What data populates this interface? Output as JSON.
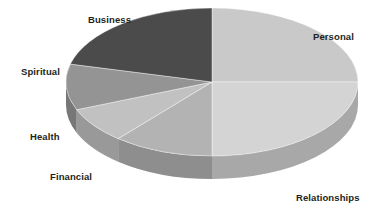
{
  "chart_data": {
    "type": "pie",
    "title": "",
    "subtitle": "",
    "xlabel": "",
    "ylabel": "",
    "legend_position": "none",
    "grid": false,
    "three_d": true,
    "background_color": "#ffffff",
    "label_color": "#231f20",
    "categories": [
      "Personal",
      "Relationships",
      "Financial",
      "Health",
      "Spiritual",
      "Business"
    ],
    "values": [
      25,
      25,
      11,
      8,
      10,
      21
    ],
    "slices": [
      {
        "label": "Personal",
        "value": 25,
        "percent": 25,
        "start_angle": 0,
        "end_angle": 90,
        "color": "#c9c9c9",
        "side_color": "#9f9f9f",
        "label_x": 313,
        "label_y": 31
      },
      {
        "label": "Relationships",
        "value": 25,
        "percent": 25,
        "start_angle": 90,
        "end_angle": 180,
        "color": "#d4d4d4",
        "side_color": "#a8a8a8",
        "label_x": 296,
        "label_y": 192
      },
      {
        "label": "Financial",
        "value": 11,
        "percent": 11,
        "start_angle": 180,
        "end_angle": 220,
        "color": "#b3b3b3",
        "side_color": "#8e8e8e",
        "label_x": 50,
        "label_y": 171
      },
      {
        "label": "Health",
        "value": 8,
        "percent": 8,
        "start_angle": 220,
        "end_angle": 248,
        "color": "#c1c1c1",
        "side_color": "#999999",
        "label_x": 30,
        "label_y": 131
      },
      {
        "label": "Spiritual",
        "value": 10,
        "percent": 10,
        "start_angle": 248,
        "end_angle": 284,
        "color": "#949494",
        "side_color": "#777777",
        "label_x": 21,
        "label_y": 66
      },
      {
        "label": "Business",
        "value": 21,
        "percent": 21,
        "start_angle": 284,
        "end_angle": 360,
        "color": "#4b4b4b",
        "side_color": "#3b3b3b",
        "label_x": 88,
        "label_y": 14
      }
    ],
    "geometry": {
      "center_x": 212,
      "center_y": 82,
      "radius_x": 146,
      "radius_y": 74,
      "depth": 23
    }
  }
}
